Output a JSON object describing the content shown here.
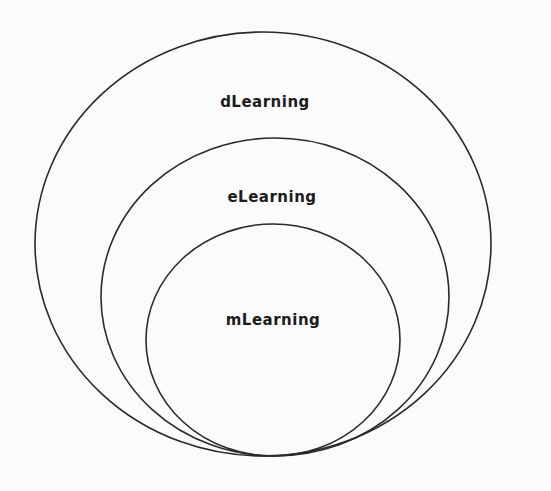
{
  "diagram": {
    "type": "nested-ellipses",
    "colors": {
      "background": "#fbfbfb",
      "stroke": "#2a2a2a",
      "text": "#1c1c1c"
    },
    "layers": [
      {
        "id": "outer",
        "label": "dLearning",
        "ellipse": {
          "cx": 263,
          "cy": 244,
          "rx": 228,
          "ry": 212
        },
        "label_pos": {
          "x": 265,
          "y": 102
        }
      },
      {
        "id": "middle",
        "label": "eLearning",
        "ellipse": {
          "cx": 275,
          "cy": 297,
          "rx": 174,
          "ry": 159
        },
        "label_pos": {
          "x": 272,
          "y": 197
        }
      },
      {
        "id": "inner",
        "label": "mLearning",
        "ellipse": {
          "cx": 273,
          "cy": 340,
          "rx": 127,
          "ry": 116
        },
        "label_pos": {
          "x": 273,
          "y": 320
        }
      }
    ],
    "relationship": "mLearning ⊂ eLearning ⊂ dLearning"
  }
}
